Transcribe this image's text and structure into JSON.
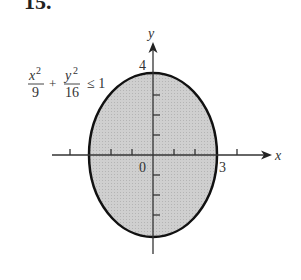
{
  "problem_number": "15.",
  "inequality": {
    "x_num": "x",
    "x_exp": "2",
    "x_den": "9",
    "plus": "+",
    "y_num": "y",
    "y_exp": "2",
    "y_den": "16",
    "relation": "≤ 1"
  },
  "axes": {
    "x_label": "x",
    "y_label": "y",
    "origin_label": "0",
    "x_intercept_label": "3",
    "y_intercept_label": "4"
  },
  "colors": {
    "fill": "#c8c8c8",
    "stroke": "#111111",
    "axis": "#333333"
  }
}
